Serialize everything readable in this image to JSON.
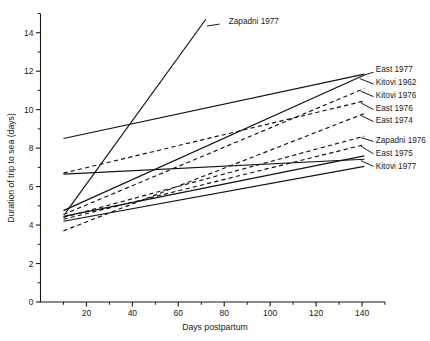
{
  "chart_data": {
    "type": "line",
    "title": "",
    "xlabel": "Days postpartum",
    "ylabel": "Duration of trip to sea (days)",
    "xlim": [
      0,
      150
    ],
    "ylim": [
      0,
      15
    ],
    "xticks": [
      0,
      20,
      40,
      60,
      80,
      100,
      120,
      140
    ],
    "xtick_labels": [
      "0",
      "20",
      "40",
      "60",
      "80",
      "100",
      "120",
      "140"
    ],
    "xminor_step": 10,
    "yticks": [
      0,
      2,
      4,
      6,
      8,
      10,
      12,
      14
    ],
    "ytick_labels": [
      "0",
      "2",
      "4",
      "6",
      "8",
      "10",
      "12",
      "14"
    ],
    "yminor_step": 1,
    "grid": false,
    "legend_position": "right-inline-labels",
    "series": [
      {
        "name": "Zapadni 1977",
        "style": "solid",
        "label_x": 82,
        "label_y": 14.55,
        "leader": [
          [
            78,
            14.45
          ],
          [
            72.5,
            14.35
          ]
        ],
        "x": [
          11,
          72
        ],
        "y": [
          4.65,
          14.7
        ]
      },
      {
        "name": "East 1977",
        "style": "solid",
        "label_x": 146,
        "label_y": 12.05,
        "leader": [
          [
            145,
            11.95
          ],
          [
            140.5,
            11.78
          ]
        ],
        "x": [
          10,
          141
        ],
        "y": [
          8.5,
          11.85
        ]
      },
      {
        "name": "Kitovi 1962",
        "style": "solid",
        "label_x": 146,
        "label_y": 11.38,
        "leader": [
          [
            145,
            11.33
          ],
          [
            139,
            11.62
          ]
        ],
        "x": [
          10,
          141
        ],
        "y": [
          4.75,
          11.8
        ]
      },
      {
        "name": "Kitovi 1976",
        "style": "dashed",
        "label_x": 146,
        "label_y": 10.72,
        "leader": [
          [
            145,
            10.68
          ],
          [
            139.5,
            10.95
          ]
        ],
        "x": [
          10,
          141
        ],
        "y": [
          4.55,
          11.1
        ]
      },
      {
        "name": "East 1976",
        "style": "dashed",
        "label_x": 146,
        "label_y": 10.05,
        "leader": [
          [
            145,
            10.0
          ],
          [
            139.5,
            10.35
          ]
        ],
        "x": [
          10,
          141
        ],
        "y": [
          6.7,
          10.45
        ]
      },
      {
        "name": "East 1974",
        "style": "dashed",
        "label_x": 146,
        "label_y": 9.4,
        "leader": [
          [
            145,
            9.38
          ],
          [
            139.5,
            9.7
          ]
        ],
        "x": [
          10,
          141
        ],
        "y": [
          3.7,
          9.8
        ]
      },
      {
        "name": "Zapadni 1976",
        "style": "dashed",
        "label_x": 146,
        "label_y": 8.38,
        "leader": [
          [
            145,
            8.35
          ],
          [
            139.5,
            8.55
          ]
        ],
        "x": [
          10,
          141
        ],
        "y": [
          4.4,
          8.62
        ]
      },
      {
        "name": "East 1975",
        "style": "dashed",
        "label_x": 146,
        "label_y": 7.72,
        "leader": [
          [
            145,
            7.7
          ],
          [
            139.5,
            8.1
          ]
        ],
        "x": [
          10,
          141
        ],
        "y": [
          4.3,
          8.18
        ]
      },
      {
        "name": "Kitovi 1977",
        "style": "solid",
        "label_x": 146,
        "label_y": 7.05,
        "leader": [
          [
            145,
            7.05
          ],
          [
            139.5,
            7.35
          ]
        ],
        "x": [
          10,
          141
        ],
        "y": [
          6.65,
          7.42
        ]
      },
      {
        "name": "unlabeled-series-a",
        "style": "solid",
        "x": [
          10,
          141
        ],
        "y": [
          4.45,
          7.6
        ]
      },
      {
        "name": "unlabeled-series-b",
        "style": "solid",
        "x": [
          10,
          141
        ],
        "y": [
          4.2,
          7.05
        ]
      }
    ]
  },
  "figure": {
    "axis_color": "#1a1a1a"
  }
}
